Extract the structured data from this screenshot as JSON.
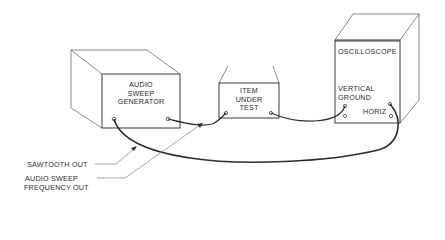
{
  "diagram": {
    "type": "equipment-hookup",
    "devices": {
      "generator": {
        "label_lines": [
          "AUDIO",
          "SWEEP",
          "GENERATOR"
        ]
      },
      "item_under_test": {
        "label_lines": [
          "ITEM",
          "UNDER",
          "TEST"
        ]
      },
      "oscilloscope": {
        "title": "OSCILLOSCOPE",
        "vertical_label": "VERTICAL",
        "ground_label": "GROUND",
        "horiz_label": "HORIZ"
      }
    },
    "callouts": {
      "sawtooth_out": "SAWTOOTH OUT",
      "audio_sweep_line1": "AUDIO SWEEP",
      "audio_sweep_line2": "FREQUENCY OUT"
    },
    "colors": {
      "line": "#555555",
      "cable": "#2b2b2b",
      "text": "#2a2a2a",
      "background": "#ffffff"
    }
  }
}
